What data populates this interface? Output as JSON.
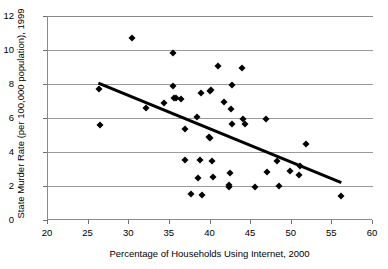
{
  "chart_data": {
    "type": "scatter",
    "title": "",
    "xlabel": "Percentage of Households Using Internet, 2000",
    "ylabel": "State Murder Rate (per 100,000 population), 1999",
    "xlim": [
      20,
      60
    ],
    "ylim": [
      0,
      12
    ],
    "xticks": [
      20,
      25,
      30,
      35,
      40,
      45,
      50,
      55,
      60
    ],
    "yticks": [
      0,
      2,
      4,
      6,
      8,
      10,
      12
    ],
    "grid": "horizontal",
    "legend": "none",
    "marker": "diamond",
    "marker_color": "#000000",
    "points": [
      {
        "x": 26.3,
        "y": 7.7
      },
      {
        "x": 26.4,
        "y": 5.6
      },
      {
        "x": 30.3,
        "y": 10.7
      },
      {
        "x": 32.0,
        "y": 6.6
      },
      {
        "x": 34.3,
        "y": 6.9
      },
      {
        "x": 35.4,
        "y": 9.8
      },
      {
        "x": 35.4,
        "y": 7.9
      },
      {
        "x": 35.5,
        "y": 7.2
      },
      {
        "x": 35.8,
        "y": 7.15
      },
      {
        "x": 36.4,
        "y": 7.1
      },
      {
        "x": 36.8,
        "y": 5.35
      },
      {
        "x": 36.9,
        "y": 3.55
      },
      {
        "x": 37.6,
        "y": 1.55
      },
      {
        "x": 38.3,
        "y": 6.05
      },
      {
        "x": 38.4,
        "y": 2.45
      },
      {
        "x": 38.7,
        "y": 3.55
      },
      {
        "x": 38.8,
        "y": 7.45
      },
      {
        "x": 38.9,
        "y": 1.45
      },
      {
        "x": 39.8,
        "y": 4.9
      },
      {
        "x": 39.9,
        "y": 4.85
      },
      {
        "x": 39.9,
        "y": 7.6
      },
      {
        "x": 40.1,
        "y": 7.65
      },
      {
        "x": 40.2,
        "y": 3.45
      },
      {
        "x": 40.3,
        "y": 2.55
      },
      {
        "x": 40.9,
        "y": 9.05
      },
      {
        "x": 41.7,
        "y": 6.95
      },
      {
        "x": 42.3,
        "y": 2.05
      },
      {
        "x": 42.3,
        "y": 1.95
      },
      {
        "x": 42.4,
        "y": 2.75
      },
      {
        "x": 42.5,
        "y": 6.55
      },
      {
        "x": 42.6,
        "y": 7.95
      },
      {
        "x": 42.6,
        "y": 5.65
      },
      {
        "x": 43.9,
        "y": 8.95
      },
      {
        "x": 44.0,
        "y": 5.95
      },
      {
        "x": 44.2,
        "y": 5.65
      },
      {
        "x": 45.5,
        "y": 1.95
      },
      {
        "x": 46.8,
        "y": 5.95
      },
      {
        "x": 46.9,
        "y": 2.8
      },
      {
        "x": 48.2,
        "y": 3.45
      },
      {
        "x": 48.4,
        "y": 2.0
      },
      {
        "x": 49.8,
        "y": 2.9
      },
      {
        "x": 50.9,
        "y": 2.65
      },
      {
        "x": 51.0,
        "y": 3.2
      },
      {
        "x": 51.8,
        "y": 4.5
      },
      {
        "x": 56.0,
        "y": 1.4
      }
    ],
    "trendline": {
      "x0": 26.2,
      "y0": 8.05,
      "x1": 56.1,
      "y1": 2.2,
      "color": "#000000",
      "width": 3
    }
  }
}
